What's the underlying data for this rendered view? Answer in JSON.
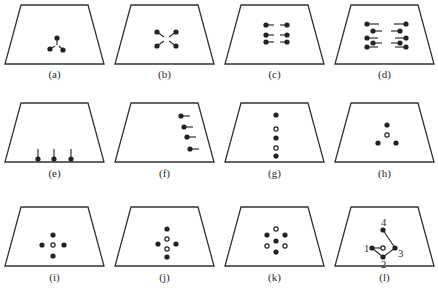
{
  "figure": {
    "width": 438,
    "height": 297,
    "colors": {
      "stroke": "#333333",
      "filled": "#222222",
      "hollow_fill": "#ffffff"
    },
    "trapezoid": {
      "top_inset": 16,
      "top_width": 67,
      "bottom_width": 99,
      "height": 59
    },
    "panels": [
      {
        "id": "a",
        "label": "(a)",
        "x": 5,
        "y": 5,
        "label_y": 78,
        "dots": [
          {
            "x": 52,
            "y": 33,
            "type": "filled"
          },
          {
            "x": 45,
            "y": 44,
            "type": "filled"
          },
          {
            "x": 58,
            "y": 45,
            "type": "filled"
          }
        ],
        "lines": [
          [
            52,
            33,
            52,
            40
          ],
          [
            45,
            44,
            50,
            41
          ],
          [
            58,
            45,
            54,
            41
          ]
        ],
        "labels": []
      },
      {
        "id": "b",
        "label": "(b)",
        "x": 115,
        "y": 5,
        "label_y": 78,
        "dots": [
          {
            "x": 42,
            "y": 27,
            "type": "filled"
          },
          {
            "x": 61,
            "y": 27,
            "type": "filled"
          },
          {
            "x": 42,
            "y": 41,
            "type": "filled"
          },
          {
            "x": 61,
            "y": 41,
            "type": "filled"
          }
        ],
        "lines": [
          [
            42,
            27,
            49,
            32
          ],
          [
            61,
            27,
            54,
            32
          ],
          [
            42,
            41,
            49,
            36
          ],
          [
            61,
            41,
            54,
            36
          ]
        ],
        "labels": []
      },
      {
        "id": "c",
        "label": "(c)",
        "x": 225,
        "y": 5,
        "label_y": 78,
        "dots": [
          {
            "x": 41,
            "y": 20,
            "type": "filled"
          },
          {
            "x": 62,
            "y": 20,
            "type": "filled"
          },
          {
            "x": 41,
            "y": 30,
            "type": "filled"
          },
          {
            "x": 62,
            "y": 30,
            "type": "filled"
          },
          {
            "x": 41,
            "y": 37,
            "type": "filled"
          },
          {
            "x": 62,
            "y": 37,
            "type": "filled"
          }
        ],
        "lines": [
          [
            41,
            20,
            49,
            20
          ],
          [
            55,
            20,
            62,
            20
          ],
          [
            41,
            30,
            49,
            30
          ],
          [
            55,
            30,
            62,
            30
          ],
          [
            41,
            37,
            49,
            37
          ],
          [
            55,
            37,
            62,
            37
          ]
        ],
        "labels": []
      },
      {
        "id": "d",
        "label": "(d)",
        "x": 335,
        "y": 5,
        "label_y": 78,
        "dots": [
          {
            "x": 32,
            "y": 19,
            "type": "filled"
          },
          {
            "x": 71,
            "y": 19,
            "type": "filled"
          },
          {
            "x": 38,
            "y": 26,
            "type": "filled"
          },
          {
            "x": 65,
            "y": 26,
            "type": "filled"
          },
          {
            "x": 32,
            "y": 33,
            "type": "filled"
          },
          {
            "x": 71,
            "y": 33,
            "type": "filled"
          },
          {
            "x": 38,
            "y": 38,
            "type": "filled"
          },
          {
            "x": 65,
            "y": 38,
            "type": "filled"
          },
          {
            "x": 32,
            "y": 42,
            "type": "filled"
          },
          {
            "x": 71,
            "y": 42,
            "type": "filled"
          }
        ],
        "lines": [
          [
            32,
            19,
            44,
            19
          ],
          [
            59,
            19,
            71,
            19
          ],
          [
            38,
            26,
            47,
            26
          ],
          [
            56,
            26,
            65,
            26
          ],
          [
            32,
            33,
            43,
            33
          ],
          [
            60,
            33,
            71,
            33
          ],
          [
            38,
            38,
            47,
            38
          ],
          [
            56,
            38,
            65,
            38
          ],
          [
            32,
            42,
            43,
            42
          ],
          [
            60,
            42,
            71,
            42
          ]
        ],
        "labels": []
      },
      {
        "id": "e",
        "label": "(e)",
        "x": 5,
        "y": 103,
        "label_y": 177,
        "dots": [
          {
            "x": 33,
            "y": 56,
            "type": "filled"
          },
          {
            "x": 49,
            "y": 56,
            "type": "filled"
          },
          {
            "x": 66,
            "y": 56,
            "type": "filled"
          }
        ],
        "lines": [
          [
            33,
            56,
            33,
            46
          ],
          [
            49,
            56,
            49,
            46
          ],
          [
            66,
            56,
            66,
            46
          ]
        ],
        "labels": []
      },
      {
        "id": "f",
        "label": "(f)",
        "x": 115,
        "y": 103,
        "label_y": 177,
        "dots": [
          {
            "x": 66,
            "y": 13,
            "type": "filled"
          },
          {
            "x": 69,
            "y": 24,
            "type": "filled"
          },
          {
            "x": 72,
            "y": 34,
            "type": "filled"
          },
          {
            "x": 75,
            "y": 46,
            "type": "filled"
          }
        ],
        "lines": [
          [
            66,
            13,
            75,
            13
          ],
          [
            69,
            24,
            78,
            24
          ],
          [
            72,
            34,
            81,
            34
          ],
          [
            75,
            46,
            84,
            46
          ]
        ],
        "labels": []
      },
      {
        "id": "g",
        "label": "(g)",
        "x": 225,
        "y": 103,
        "label_y": 177,
        "dots": [
          {
            "x": 51,
            "y": 12,
            "type": "filled"
          },
          {
            "x": 51,
            "y": 26,
            "type": "hollow"
          },
          {
            "x": 51,
            "y": 35,
            "type": "filled"
          },
          {
            "x": 51,
            "y": 45,
            "type": "hollow"
          },
          {
            "x": 51,
            "y": 53,
            "type": "filled"
          }
        ],
        "lines": [],
        "labels": []
      },
      {
        "id": "h",
        "label": "(h)",
        "x": 335,
        "y": 103,
        "label_y": 177,
        "dots": [
          {
            "x": 52,
            "y": 22,
            "type": "filled"
          },
          {
            "x": 52,
            "y": 32,
            "type": "hollow"
          },
          {
            "x": 43,
            "y": 40,
            "type": "filled"
          },
          {
            "x": 61,
            "y": 40,
            "type": "filled"
          }
        ],
        "lines": [],
        "labels": []
      },
      {
        "id": "i",
        "label": "(i)",
        "x": 5,
        "y": 207,
        "label_y": 281,
        "dots": [
          {
            "x": 48,
            "y": 28,
            "type": "filled"
          },
          {
            "x": 37,
            "y": 38,
            "type": "filled"
          },
          {
            "x": 48,
            "y": 38,
            "type": "hollow"
          },
          {
            "x": 59,
            "y": 38,
            "type": "filled"
          },
          {
            "x": 48,
            "y": 49,
            "type": "filled"
          }
        ],
        "lines": [],
        "labels": []
      },
      {
        "id": "j",
        "label": "(j)",
        "x": 115,
        "y": 207,
        "label_y": 281,
        "dots": [
          {
            "x": 52,
            "y": 22,
            "type": "filled"
          },
          {
            "x": 52,
            "y": 32,
            "type": "hollow"
          },
          {
            "x": 43,
            "y": 37,
            "type": "filled"
          },
          {
            "x": 61,
            "y": 37,
            "type": "filled"
          },
          {
            "x": 52,
            "y": 42,
            "type": "hollow"
          },
          {
            "x": 52,
            "y": 50,
            "type": "filled"
          }
        ],
        "lines": [],
        "labels": []
      },
      {
        "id": "k",
        "label": "(k)",
        "x": 225,
        "y": 207,
        "label_y": 281,
        "dots": [
          {
            "x": 51,
            "y": 22,
            "type": "hollow"
          },
          {
            "x": 42,
            "y": 28,
            "type": "filled"
          },
          {
            "x": 60,
            "y": 28,
            "type": "filled"
          },
          {
            "x": 51,
            "y": 34,
            "type": "filled"
          },
          {
            "x": 42,
            "y": 39,
            "type": "hollow"
          },
          {
            "x": 60,
            "y": 39,
            "type": "hollow"
          },
          {
            "x": 51,
            "y": 45,
            "type": "filled"
          }
        ],
        "lines": [],
        "labels": []
      },
      {
        "id": "l",
        "label": "(l)",
        "x": 335,
        "y": 207,
        "label_y": 281,
        "dots": [
          {
            "x": 48,
            "y": 23,
            "type": "filled"
          },
          {
            "x": 37,
            "y": 41,
            "type": "filled"
          },
          {
            "x": 48,
            "y": 41,
            "type": "hollow"
          },
          {
            "x": 60,
            "y": 41,
            "type": "filled"
          },
          {
            "x": 48,
            "y": 50,
            "type": "filled"
          }
        ],
        "lines": [
          [
            48,
            23,
            60,
            41
          ],
          [
            37,
            41,
            48,
            41
          ],
          [
            37,
            41,
            48,
            50
          ],
          [
            48,
            50,
            60,
            41
          ]
        ],
        "labels": [
          {
            "text": "4",
            "x": 46,
            "y": 19
          },
          {
            "text": "1",
            "x": 29,
            "y": 45
          },
          {
            "text": "3",
            "x": 63,
            "y": 50
          },
          {
            "text": "2",
            "x": 46,
            "y": 61
          }
        ]
      }
    ]
  }
}
